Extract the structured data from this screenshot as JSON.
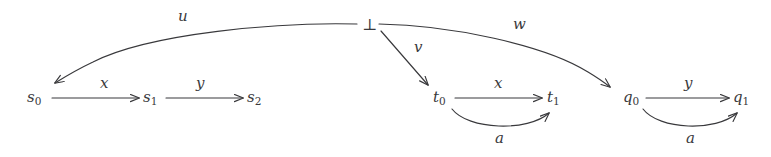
{
  "figure": {
    "kind": "commutative-diagram",
    "background_color": "#ffffff",
    "ink_color": "#39393c",
    "width": 771,
    "height": 157
  },
  "nodes": {
    "bot": {
      "base": "⊥",
      "sub": ""
    },
    "s0": {
      "base": "s",
      "sub": "0"
    },
    "s1": {
      "base": "s",
      "sub": "1"
    },
    "s2": {
      "base": "s",
      "sub": "2"
    },
    "t0": {
      "base": "t",
      "sub": "0"
    },
    "t1": {
      "base": "t",
      "sub": "1"
    },
    "q0": {
      "base": "q",
      "sub": "0"
    },
    "q1": {
      "base": "q",
      "sub": "1"
    }
  },
  "edges": [
    {
      "id": "u",
      "label": "u",
      "from": "bot",
      "to": "s0",
      "shape": "curve"
    },
    {
      "id": "v",
      "label": "v",
      "from": "bot",
      "to": "t0",
      "shape": "straight"
    },
    {
      "id": "w",
      "label": "w",
      "from": "bot",
      "to": "q0",
      "shape": "curve"
    },
    {
      "id": "s0-s1",
      "label": "x",
      "from": "s0",
      "to": "s1",
      "shape": "straight"
    },
    {
      "id": "s1-s2",
      "label": "y",
      "from": "s1",
      "to": "s2",
      "shape": "straight"
    },
    {
      "id": "t0-t1",
      "label": "x",
      "from": "t0",
      "to": "t1",
      "shape": "straight"
    },
    {
      "id": "t0-t1-a",
      "label": "a",
      "from": "t0",
      "to": "t1",
      "shape": "arc-below"
    },
    {
      "id": "q0-q1",
      "label": "y",
      "from": "q0",
      "to": "q1",
      "shape": "straight"
    },
    {
      "id": "q0-q1-a",
      "label": "a",
      "from": "q0",
      "to": "q1",
      "shape": "arc-below"
    }
  ]
}
